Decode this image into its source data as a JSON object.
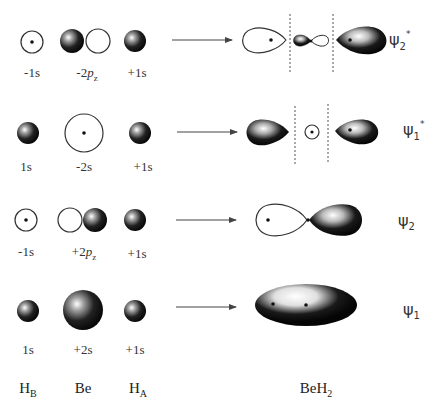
{
  "diagram": {
    "type": "molecular-orbital-diagram",
    "molecule": "BeH2",
    "columns": {
      "h_b": {
        "symbol": "H",
        "subscript": "B"
      },
      "be": {
        "symbol": "Be",
        "subscript": ""
      },
      "h_a": {
        "symbol": "H",
        "subscript": "A"
      },
      "product": {
        "symbol": "BeH",
        "subscript": "2"
      }
    },
    "rows": [
      {
        "id": "psi2-star",
        "h_b_label": "-1s",
        "be_label_prefix": "-2",
        "be_label_orbital": "p",
        "be_label_sub": "z",
        "h_a_label": "+1s",
        "mo_symbol": "ψ",
        "mo_sub": "2",
        "mo_sup": "*"
      },
      {
        "id": "psi1-star",
        "h_b_label": "1s",
        "be_label_prefix": "-2s",
        "be_label_orbital": "",
        "be_label_sub": "",
        "h_a_label": "+1s",
        "mo_symbol": "ψ",
        "mo_sub": "1",
        "mo_sup": "*"
      },
      {
        "id": "psi2",
        "h_b_label": "-1s",
        "be_label_prefix": "+2",
        "be_label_orbital": "p",
        "be_label_sub": "z",
        "h_a_label": "+1s",
        "mo_symbol": "ψ",
        "mo_sub": "2",
        "mo_sup": ""
      },
      {
        "id": "psi1",
        "h_b_label": "1s",
        "be_label_prefix": "+2s",
        "be_label_orbital": "",
        "be_label_sub": "",
        "h_a_label": "+1s",
        "mo_symbol": "ψ",
        "mo_sub": "1",
        "mo_sup": ""
      }
    ],
    "colors": {
      "filled_lobe": "#111111",
      "highlight": "#ffffff",
      "outline": "#333333",
      "node_line": "#555555",
      "arrow": "#444444"
    }
  }
}
